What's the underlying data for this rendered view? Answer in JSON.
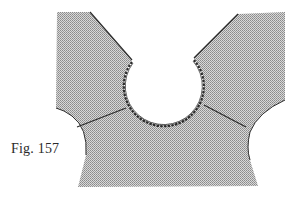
{
  "figure": {
    "caption": "Fig. 157",
    "colors": {
      "fabric_fill": "#bdbdbd",
      "outline": "#2b2b2b",
      "background": "#ffffff"
    },
    "parts": [
      {
        "name": "left-shoulder",
        "label": ""
      },
      {
        "name": "right-shoulder",
        "label": ""
      },
      {
        "name": "round-neckline",
        "label": ""
      },
      {
        "name": "left-armhole",
        "label": ""
      },
      {
        "name": "right-armhole",
        "label": ""
      },
      {
        "name": "left-seam-line",
        "label": ""
      },
      {
        "name": "right-seam-line",
        "label": ""
      }
    ]
  }
}
